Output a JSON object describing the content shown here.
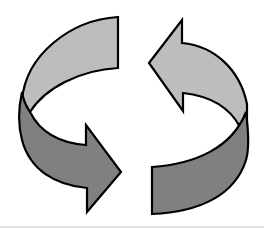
{
  "figure": {
    "title": "Cycle arrows",
    "colors": {
      "background": "#ffffff",
      "light_ribbon": "#bdbdbd",
      "dark_ribbon": "#808080",
      "outline": "#000000",
      "divider": "#e3e3e3"
    },
    "arrows": [
      {
        "name": "left-arrow",
        "direction": "clockwise-down-right",
        "back_face": "light",
        "front_face": "dark"
      },
      {
        "name": "right-arrow",
        "direction": "clockwise-up-left",
        "back_face": "light",
        "front_face": "dark"
      }
    ]
  }
}
